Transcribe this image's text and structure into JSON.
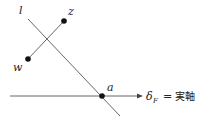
{
  "diagram": {
    "line_l": {
      "label": "l",
      "x1": 28,
      "y1": 19,
      "x2": 120,
      "y2": 116,
      "color": "#555555"
    },
    "segment_wz": {
      "x1": 28,
      "y1": 59,
      "x2": 64,
      "y2": 21,
      "color": "#555555"
    },
    "axis": {
      "x1": 10,
      "y1": 96,
      "x2": 142,
      "y2": 96,
      "color": "#555555"
    },
    "points": [
      {
        "name": "z",
        "label": "z",
        "x": 64,
        "y": 21,
        "label_x": 69,
        "label_y": 15
      },
      {
        "name": "w",
        "label": "w",
        "x": 28,
        "y": 59,
        "label_x": 14,
        "label_y": 71
      },
      {
        "name": "a",
        "label": "a",
        "x": 102,
        "y": 96,
        "label_x": 107,
        "label_y": 91
      }
    ],
    "labels": {
      "l": "l",
      "z": "z",
      "w": "w",
      "a": "a",
      "axis_delta": "δ",
      "axis_sub": "F",
      "axis_eq": "=",
      "axis_name": "実軸"
    }
  }
}
